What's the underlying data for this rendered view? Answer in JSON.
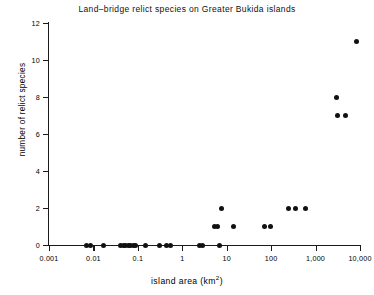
{
  "chart_data": {
    "type": "scatter",
    "title": "Land–bridge relict species on Greater Bukida islands",
    "xlabel": "island area (km",
    "xlabel_sup": "2",
    "xlabel_suffix": ")",
    "ylabel": "number of relict species",
    "xscale": "log",
    "yscale": "linear",
    "xlim": [
      0.001,
      10000
    ],
    "ylim": [
      0,
      12
    ],
    "grid": false,
    "legend": null,
    "marker": "filled-circle",
    "marker_color": "#111111",
    "xticks": [
      0.001,
      0.01,
      0.1,
      1,
      10,
      100,
      1000,
      10000
    ],
    "xtick_labels": [
      "0.001",
      "0.01",
      "0.1",
      "1",
      "10",
      "100",
      "1,000",
      "10,000"
    ],
    "yticks": [
      0,
      2,
      4,
      6,
      8,
      10,
      12
    ],
    "ytick_labels": [
      "0",
      "2",
      "4",
      "6",
      "8",
      "10",
      "12"
    ],
    "points": [
      {
        "x": 0.007,
        "y": 0
      },
      {
        "x": 0.0085,
        "y": 0
      },
      {
        "x": 0.017,
        "y": 0
      },
      {
        "x": 0.04,
        "y": 0
      },
      {
        "x": 0.047,
        "y": 0
      },
      {
        "x": 0.053,
        "y": 0
      },
      {
        "x": 0.06,
        "y": 0
      },
      {
        "x": 0.068,
        "y": 0
      },
      {
        "x": 0.078,
        "y": 0
      },
      {
        "x": 0.088,
        "y": 0
      },
      {
        "x": 0.15,
        "y": 0
      },
      {
        "x": 0.31,
        "y": 0
      },
      {
        "x": 0.45,
        "y": 0
      },
      {
        "x": 0.55,
        "y": 0
      },
      {
        "x": 2.5,
        "y": 0
      },
      {
        "x": 2.9,
        "y": 0
      },
      {
        "x": 6.8,
        "y": 0
      },
      {
        "x": 5.2,
        "y": 1
      },
      {
        "x": 6.3,
        "y": 1
      },
      {
        "x": 14.0,
        "y": 1
      },
      {
        "x": 70.0,
        "y": 1
      },
      {
        "x": 95.0,
        "y": 1
      },
      {
        "x": 7.5,
        "y": 2
      },
      {
        "x": 250.0,
        "y": 2
      },
      {
        "x": 360.0,
        "y": 2
      },
      {
        "x": 600.0,
        "y": 2
      },
      {
        "x": 3000.0,
        "y": 8
      },
      {
        "x": 3100.0,
        "y": 7
      },
      {
        "x": 4600.0,
        "y": 7
      },
      {
        "x": 8500.0,
        "y": 11
      }
    ]
  }
}
